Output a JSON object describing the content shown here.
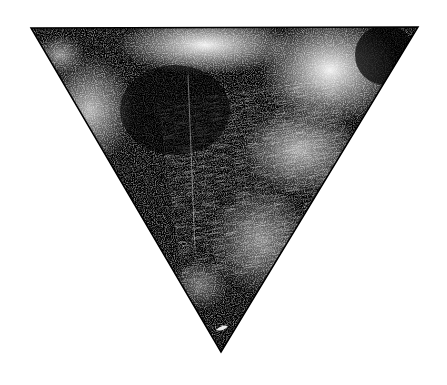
{
  "image": {
    "subject": "inverted triangle with grungy black-and-white texture",
    "background_color": "#ffffff",
    "ink_color": "#000000",
    "shape": {
      "type": "triangle",
      "orientation": "pointing-down",
      "vertices": [
        [
          31,
          28
        ],
        [
          418,
          27
        ],
        [
          221,
          352
        ]
      ]
    }
  }
}
